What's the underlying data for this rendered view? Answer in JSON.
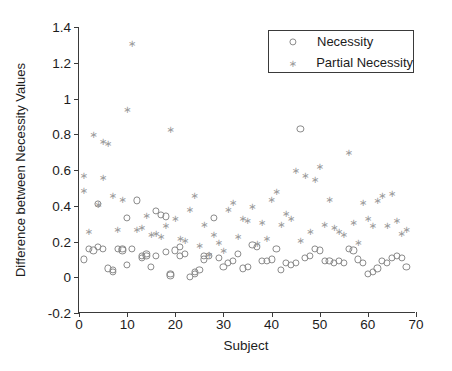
{
  "chart_data": {
    "type": "scatter",
    "title": "",
    "xlabel": "Subject",
    "ylabel": "Difference between Necessity Values",
    "xlim": [
      0,
      70
    ],
    "ylim": [
      -0.2,
      1.4
    ],
    "xticks": [
      0,
      10,
      20,
      30,
      40,
      50,
      60,
      70
    ],
    "xticklabels": [
      "0",
      "10",
      "20",
      "30",
      "40",
      "50",
      "60",
      "70"
    ],
    "yticks": [
      -0.2,
      0,
      0.2,
      0.4,
      0.6,
      0.8,
      1,
      1.2,
      1.4
    ],
    "yticklabels": [
      "-0.2",
      "0",
      "0.2",
      "0.4",
      "0.6",
      "0.8",
      "1",
      "1.2",
      "1.4"
    ],
    "grid": false,
    "legend_position": "top-right",
    "series": [
      {
        "name": "Necessity",
        "marker": "open-circle",
        "color": "#8a8a8a",
        "x": [
          1,
          2,
          3,
          4,
          4,
          5,
          6,
          7,
          7,
          8,
          9,
          9,
          10,
          10,
          11,
          12,
          13,
          13,
          14,
          14,
          15,
          16,
          16,
          17,
          18,
          18,
          19,
          19,
          20,
          21,
          21,
          22,
          23,
          24,
          24,
          25,
          26,
          26,
          27,
          28,
          29,
          30,
          31,
          32,
          33,
          34,
          35,
          36,
          37,
          38,
          39,
          40,
          41,
          42,
          43,
          44,
          45,
          46,
          47,
          48,
          49,
          50,
          51,
          52,
          53,
          54,
          55,
          56,
          57,
          58,
          59,
          60,
          61,
          62,
          63,
          64,
          65,
          66,
          67,
          68
        ],
        "y": [
          0.1,
          0.16,
          0.15,
          0.41,
          0.17,
          0.16,
          0.05,
          0.04,
          0.03,
          0.16,
          0.16,
          0.15,
          0.07,
          0.33,
          0.16,
          0.43,
          0.12,
          0.11,
          0.13,
          0.12,
          0.06,
          0.12,
          0.37,
          0.35,
          0.34,
          0.14,
          0.02,
          0.01,
          0.15,
          0.12,
          0.17,
          0.13,
          0.0,
          0.02,
          0.03,
          0.04,
          0.1,
          0.12,
          0.12,
          0.33,
          0.11,
          0.06,
          0.08,
          0.09,
          0.13,
          0.05,
          0.06,
          0.18,
          0.17,
          0.09,
          0.09,
          0.1,
          0.16,
          0.04,
          0.08,
          0.07,
          0.08,
          0.83,
          0.11,
          0.12,
          0.16,
          0.15,
          0.09,
          0.09,
          0.08,
          0.09,
          0.08,
          0.16,
          0.15,
          0.1,
          0.08,
          0.02,
          0.03,
          0.05,
          0.09,
          0.08,
          0.11,
          0.12,
          0.11,
          0.06
        ]
      },
      {
        "name": "Partial Necessity",
        "marker": "asterisk",
        "color": "#9a9a9a",
        "x": [
          1,
          1,
          2,
          3,
          4,
          5,
          5,
          6,
          7,
          8,
          9,
          10,
          11,
          12,
          13,
          14,
          15,
          16,
          17,
          18,
          19,
          20,
          21,
          22,
          23,
          24,
          25,
          26,
          27,
          28,
          29,
          30,
          31,
          32,
          33,
          34,
          35,
          36,
          37,
          38,
          39,
          40,
          41,
          42,
          43,
          44,
          45,
          46,
          47,
          48,
          49,
          50,
          51,
          52,
          53,
          54,
          55,
          56,
          57,
          58,
          59,
          60,
          61,
          62,
          63,
          64,
          65,
          66,
          67,
          68
        ],
        "y": [
          0.49,
          0.57,
          0.26,
          0.8,
          0.41,
          0.76,
          0.56,
          0.75,
          0.46,
          0.27,
          0.44,
          0.94,
          1.31,
          0.27,
          0.28,
          0.35,
          0.24,
          0.25,
          0.23,
          0.29,
          0.83,
          0.33,
          0.22,
          0.21,
          0.38,
          0.46,
          0.18,
          0.3,
          0.13,
          0.24,
          0.2,
          0.15,
          0.38,
          0.42,
          0.23,
          0.33,
          0.32,
          0.4,
          0.19,
          0.31,
          0.22,
          0.44,
          0.48,
          0.3,
          0.36,
          0.33,
          0.6,
          0.21,
          0.57,
          0.26,
          0.55,
          0.62,
          0.3,
          0.44,
          0.28,
          0.26,
          0.24,
          0.7,
          0.31,
          0.2,
          0.42,
          0.33,
          0.29,
          0.43,
          0.46,
          0.29,
          0.47,
          0.32,
          0.25,
          0.27
        ]
      }
    ]
  },
  "legend": {
    "items": [
      {
        "label": "Necessity",
        "marker": "open-circle"
      },
      {
        "label": "Partial Necessity",
        "marker": "asterisk"
      }
    ]
  }
}
